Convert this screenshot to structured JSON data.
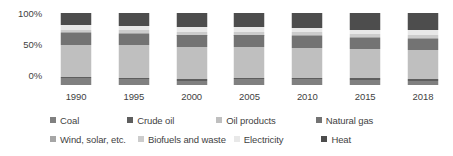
{
  "chart_data": {
    "type": "bar",
    "stacked": true,
    "normalized_percent": true,
    "title": "",
    "subtitle": "",
    "xlabel": "",
    "ylabel": "",
    "ylim": [
      0,
      100
    ],
    "ytick_labels": [
      "100%",
      "50%",
      "0%"
    ],
    "ytick_values": [
      100,
      50,
      0
    ],
    "grid": false,
    "legend_position": "bottom",
    "categories": [
      "1990",
      "1995",
      "2000",
      "2005",
      "2010",
      "2015",
      "2018"
    ],
    "series": [
      {
        "name": "Coal",
        "color": "#808080",
        "values": [
          9,
          8,
          6,
          8,
          8,
          7,
          6
        ]
      },
      {
        "name": "Crude oil",
        "color": "#5e5e5e",
        "values": [
          2,
          2,
          2,
          2,
          2,
          2,
          2
        ]
      },
      {
        "name": "Oil products",
        "color": "#bfbfbf",
        "values": [
          45,
          45,
          45,
          43,
          42,
          41,
          41
        ]
      },
      {
        "name": "Natural gas",
        "color": "#737373",
        "values": [
          16,
          16,
          16,
          16,
          16,
          15,
          15
        ]
      },
      {
        "name": "Wind, solar, etc.",
        "color": "#a6a6a6",
        "values": [
          1,
          1,
          1,
          1,
          1,
          1,
          1
        ]
      },
      {
        "name": "Biofuels and waste",
        "color": "#cccccc",
        "values": [
          4,
          4,
          4,
          4,
          4,
          5,
          5
        ]
      },
      {
        "name": "Electricity",
        "color": "#e8e8e8",
        "values": [
          6,
          6,
          6,
          6,
          6,
          6,
          6
        ]
      },
      {
        "name": "Heat",
        "color": "#4d4d4d",
        "values": [
          17,
          18,
          20,
          20,
          21,
          23,
          24
        ]
      }
    ]
  },
  "legend": {
    "row1": [
      "Coal",
      "Crude oil",
      "Oil products",
      "Natural gas"
    ],
    "row2": [
      "Wind, solar, etc.",
      "Biofuels and waste",
      "Electricity",
      "Heat"
    ]
  }
}
